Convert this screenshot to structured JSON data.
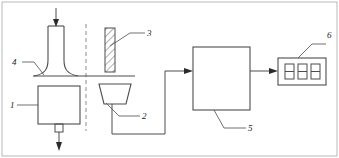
{
  "figure": {
    "type": "technical-schematic",
    "title": "",
    "background_color": "#ffffff",
    "line_color": "#4d4d4d",
    "label_color": "#1a1a1a"
  },
  "callouts": {
    "item1": "1",
    "item2": "2",
    "item3": "3",
    "item4": "4",
    "item5": "5",
    "item6": "6"
  },
  "display": {
    "digits": [
      "8",
      "8",
      "8"
    ]
  }
}
